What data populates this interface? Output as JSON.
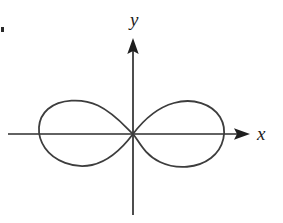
{
  "figure": {
    "canvas": {
      "width": 283,
      "height": 223,
      "background": "#ffffff"
    },
    "stroke_color": "#3d3d3d",
    "axis_color": "#2e2e2e",
    "label_color": "#1c1c1c",
    "axis_label_x": "x",
    "axis_label_y": "y",
    "curve_name": "lemniscate"
  },
  "chart_data": {
    "type": "line",
    "title": "",
    "subtitle": "",
    "xlabel": "x",
    "ylabel": "y",
    "legend": [],
    "annotations": [],
    "grid": false,
    "legend_position": "none",
    "axes": {
      "origin_px": {
        "x": 133,
        "y": 134
      },
      "x_axis": {
        "label": "x",
        "start_px": {
          "x": 8,
          "y": 134
        },
        "end_px": {
          "x": 250,
          "y": 134
        },
        "arrow": "right",
        "ticks": [],
        "tick_labels": []
      },
      "y_axis": {
        "label": "y",
        "start_px": {
          "x": 133,
          "y": 215
        },
        "end_px": {
          "x": 133,
          "y": 38
        },
        "arrow": "up",
        "ticks": [],
        "tick_labels": []
      },
      "xlim": [
        -2.6,
        2.6
      ],
      "ylim": [
        -2.1,
        2.1
      ]
    },
    "series": [
      {
        "name": "lemniscate",
        "equation": "(x^2 + y^2)^2 = a^2 (x^2 - y^2)",
        "closed": true,
        "color": "#3d3d3d",
        "linewidth": 1.8,
        "extent_px": {
          "left": 40,
          "right": 222,
          "top": 101,
          "bottom": 167
        },
        "crossing_angle_deg": 45,
        "points_px": [
          {
            "x": 133,
            "y": 134
          },
          {
            "x": 120,
            "y": 121
          },
          {
            "x": 104,
            "y": 110
          },
          {
            "x": 86,
            "y": 103
          },
          {
            "x": 68,
            "y": 102
          },
          {
            "x": 52,
            "y": 108
          },
          {
            "x": 42,
            "y": 120
          },
          {
            "x": 40,
            "y": 134
          },
          {
            "x": 42,
            "y": 148
          },
          {
            "x": 52,
            "y": 160
          },
          {
            "x": 68,
            "y": 166
          },
          {
            "x": 86,
            "y": 166
          },
          {
            "x": 104,
            "y": 159
          },
          {
            "x": 120,
            "y": 147
          },
          {
            "x": 133,
            "y": 134
          },
          {
            "x": 148,
            "y": 120
          },
          {
            "x": 166,
            "y": 108
          },
          {
            "x": 186,
            "y": 101
          },
          {
            "x": 204,
            "y": 103
          },
          {
            "x": 217,
            "y": 113
          },
          {
            "x": 222,
            "y": 127
          },
          {
            "x": 221,
            "y": 142
          },
          {
            "x": 212,
            "y": 155
          },
          {
            "x": 196,
            "y": 165
          },
          {
            "x": 178,
            "y": 167
          },
          {
            "x": 160,
            "y": 160
          },
          {
            "x": 145,
            "y": 148
          },
          {
            "x": 133,
            "y": 134
          }
        ]
      }
    ]
  }
}
